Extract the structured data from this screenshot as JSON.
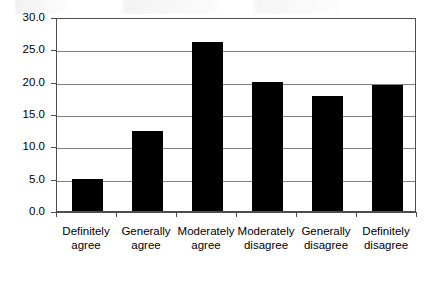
{
  "chart_data": {
    "type": "bar",
    "title": "",
    "subtitle": "",
    "xlabel": "",
    "ylabel": "",
    "categories": [
      "Definitely agree",
      "Generally agree",
      "Moderately agree",
      "Moderately disagree",
      "Generally disagree",
      "Definitely disagree"
    ],
    "category_lines": [
      [
        "Definitely",
        "agree"
      ],
      [
        "Generally",
        "agree"
      ],
      [
        "Moderately",
        "agree"
      ],
      [
        "Moderately",
        "disagree"
      ],
      [
        "Generally",
        "disagree"
      ],
      [
        "Definitely",
        "disagree"
      ]
    ],
    "values": [
      4.9,
      12.3,
      26.2,
      19.9,
      17.8,
      19.5
    ],
    "ylim": [
      0.0,
      30.0
    ],
    "ytick_step": 5.0,
    "ytick_labels": [
      "30.0",
      "25.0",
      "20.0",
      "15.0",
      "10.0",
      "5.0",
      "0.0"
    ],
    "ytick_values": [
      30.0,
      25.0,
      20.0,
      15.0,
      10.0,
      5.0,
      0.0
    ],
    "grid": true,
    "grid_axis": "y",
    "legend": false,
    "legend_position": "none",
    "bar_color": "#000000",
    "grid_color": "#808080",
    "axis_color": "#4d4d4d",
    "background_color": "#ffffff"
  }
}
